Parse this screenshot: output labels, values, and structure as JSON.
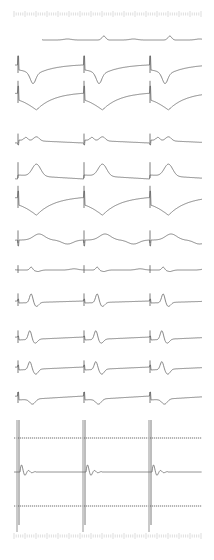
{
  "chart_data": {
    "type": "line",
    "title": "",
    "xlabel": "",
    "ylabel": "",
    "grid": false,
    "beat_x": [
      18,
      84,
      150
    ],
    "ruler_top_y": 14,
    "ruler_bottom_y": 536,
    "series": [
      {
        "name": "strip-0",
        "baseline_y": 40,
        "x_start": 42,
        "shape": "flat with small upright P/T bumps",
        "amplitude": 8
      },
      {
        "name": "strip-1",
        "baseline_y": 70,
        "x_start": 15,
        "shape": "tall R spike then deep downsloping ST into inverted trough and recovery",
        "amplitude": 18
      },
      {
        "name": "strip-2",
        "baseline_y": 100,
        "x_start": 15,
        "shape": "R spike then deep downsloping ST trough",
        "amplitude": 24
      },
      {
        "name": "strip-3",
        "baseline_y": 140,
        "x_start": 15,
        "shape": "low amplitude notched complex with small T",
        "amplitude": 8
      },
      {
        "name": "strip-4",
        "baseline_y": 175,
        "x_start": 15,
        "shape": "upright peaked T with slow decay",
        "amplitude": 16
      },
      {
        "name": "strip-5",
        "baseline_y": 205,
        "x_start": 15,
        "shape": "R spike then deep trough, concave recovery",
        "amplitude": 24
      },
      {
        "name": "strip-6",
        "baseline_y": 240,
        "x_start": 15,
        "shape": "small spike, upright rounded T",
        "amplitude": 12
      },
      {
        "name": "strip-7",
        "baseline_y": 270,
        "x_start": 15,
        "shape": "low amplitude small peaks",
        "amplitude": 6
      },
      {
        "name": "strip-8",
        "baseline_y": 303,
        "x_start": 15,
        "shape": "small spike with sharp upright wave then dip",
        "amplitude": 12
      },
      {
        "name": "strip-9",
        "baseline_y": 340,
        "x_start": 15,
        "shape": "small spike with sharp upright wave then dip",
        "amplitude": 12
      },
      {
        "name": "strip-10",
        "baseline_y": 370,
        "x_start": 15,
        "shape": "small spike with biphasic wave",
        "amplitude": 12
      },
      {
        "name": "strip-11",
        "baseline_y": 400,
        "x_start": 15,
        "shape": "R spike with small negative dip",
        "amplitude": 10
      },
      {
        "name": "rhythm-strip",
        "baseline_y": 472,
        "x_start": 14,
        "shape": "large vertical spikes spanning 420-530 with damped oscillation after each",
        "amplitude": 50
      }
    ],
    "reference_lines_y": [
      438,
      506
    ],
    "x_range": [
      14,
      202
    ]
  }
}
